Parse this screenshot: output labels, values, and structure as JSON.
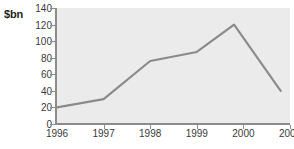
{
  "chart_data": {
    "type": "line",
    "title": "",
    "xlabel": "",
    "ylabel": "$bn",
    "unit_label": "$bn",
    "x": [
      1996,
      1997,
      1998,
      1999,
      1999.8,
      2000.8
    ],
    "values": [
      20,
      30,
      76,
      87,
      120,
      40
    ],
    "series": [
      {
        "name": "value",
        "values": [
          20,
          30,
          76,
          87,
          120,
          40
        ],
        "color": "#8a8a8a"
      }
    ],
    "xlim": [
      1996,
      2001
    ],
    "ylim": [
      0,
      140
    ],
    "ytick_labels": [
      "140",
      "120",
      "100",
      "80",
      "60",
      "40",
      "20",
      "0"
    ],
    "ytick_values": [
      140,
      120,
      100,
      80,
      60,
      40,
      20,
      0
    ],
    "xtick_labels": [
      "1996",
      "1997",
      "1998",
      "1999",
      "2000",
      "2001"
    ],
    "xtick_values": [
      1996,
      1997,
      1998,
      1999,
      2000,
      2001
    ],
    "grid": false,
    "legend": false,
    "plot_background": "#ebebeb",
    "line_color": "#8a8a8a",
    "axis_color": "#8c8c8c",
    "text_color": "#3a3a3a"
  }
}
